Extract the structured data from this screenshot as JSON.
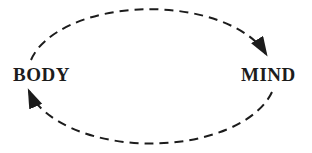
{
  "diagram": {
    "nodes": [
      {
        "id": "body",
        "label": "BODY"
      },
      {
        "id": "mind",
        "label": "MIND"
      }
    ],
    "edges": [
      {
        "from": "BODY",
        "to": "MIND",
        "line_style": "dashed",
        "arrowhead": "solid-triangle",
        "path": "top-arc"
      },
      {
        "from": "MIND",
        "to": "BODY",
        "line_style": "dashed",
        "arrowhead": "solid-triangle",
        "path": "bottom-arc"
      }
    ],
    "colors": {
      "stroke": "#1c1c1c",
      "text": "#1c1c1c",
      "background": "#ffffff"
    }
  }
}
